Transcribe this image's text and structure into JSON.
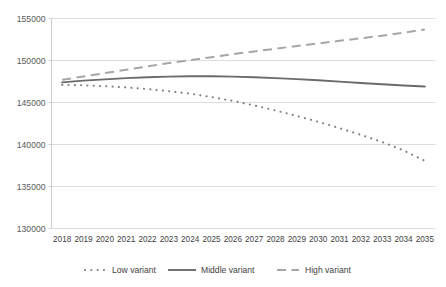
{
  "chart_data": {
    "type": "line",
    "title": "",
    "subtitle": "",
    "xlabel": "",
    "ylabel": "",
    "grid": "horizontal",
    "legend_position": "bottom",
    "ylim": [
      130000,
      155000
    ],
    "ytick_step": 5000,
    "ytick_labels": [
      "130000",
      "135000",
      "140000",
      "145000",
      "150000",
      "155000"
    ],
    "ytick_values": [
      130000,
      135000,
      140000,
      145000,
      150000,
      155000
    ],
    "categories": [
      "2018",
      "2019",
      "2020",
      "2021",
      "2022",
      "2023",
      "2024",
      "2025",
      "2026",
      "2027",
      "2028",
      "2029",
      "2030",
      "2031",
      "2032",
      "2033",
      "2034",
      "2035"
    ],
    "series": [
      {
        "name": "Low variant",
        "style": "dotted",
        "color": "#7f7f7f",
        "values": [
          147100,
          147050,
          146950,
          146800,
          146600,
          146350,
          146050,
          145650,
          145200,
          144650,
          144050,
          143400,
          142700,
          141950,
          141150,
          140300,
          139300,
          138050
        ]
      },
      {
        "name": "Middle variant",
        "style": "solid",
        "color": "#6b6b6b",
        "values": [
          147400,
          147600,
          147750,
          147900,
          148000,
          148080,
          148120,
          148120,
          148080,
          148000,
          147900,
          147780,
          147640,
          147490,
          147330,
          147180,
          147030,
          146900
        ]
      },
      {
        "name": "High variant",
        "style": "dashed",
        "color": "#a6a6a6",
        "values": [
          147700,
          148100,
          148500,
          148900,
          149300,
          149700,
          150050,
          150400,
          150750,
          151080,
          151400,
          151720,
          152030,
          152340,
          152650,
          152960,
          153300,
          153700
        ]
      }
    ]
  },
  "legend": {
    "items": [
      {
        "label": "Low variant"
      },
      {
        "label": "Middle variant"
      },
      {
        "label": "High variant"
      }
    ]
  }
}
